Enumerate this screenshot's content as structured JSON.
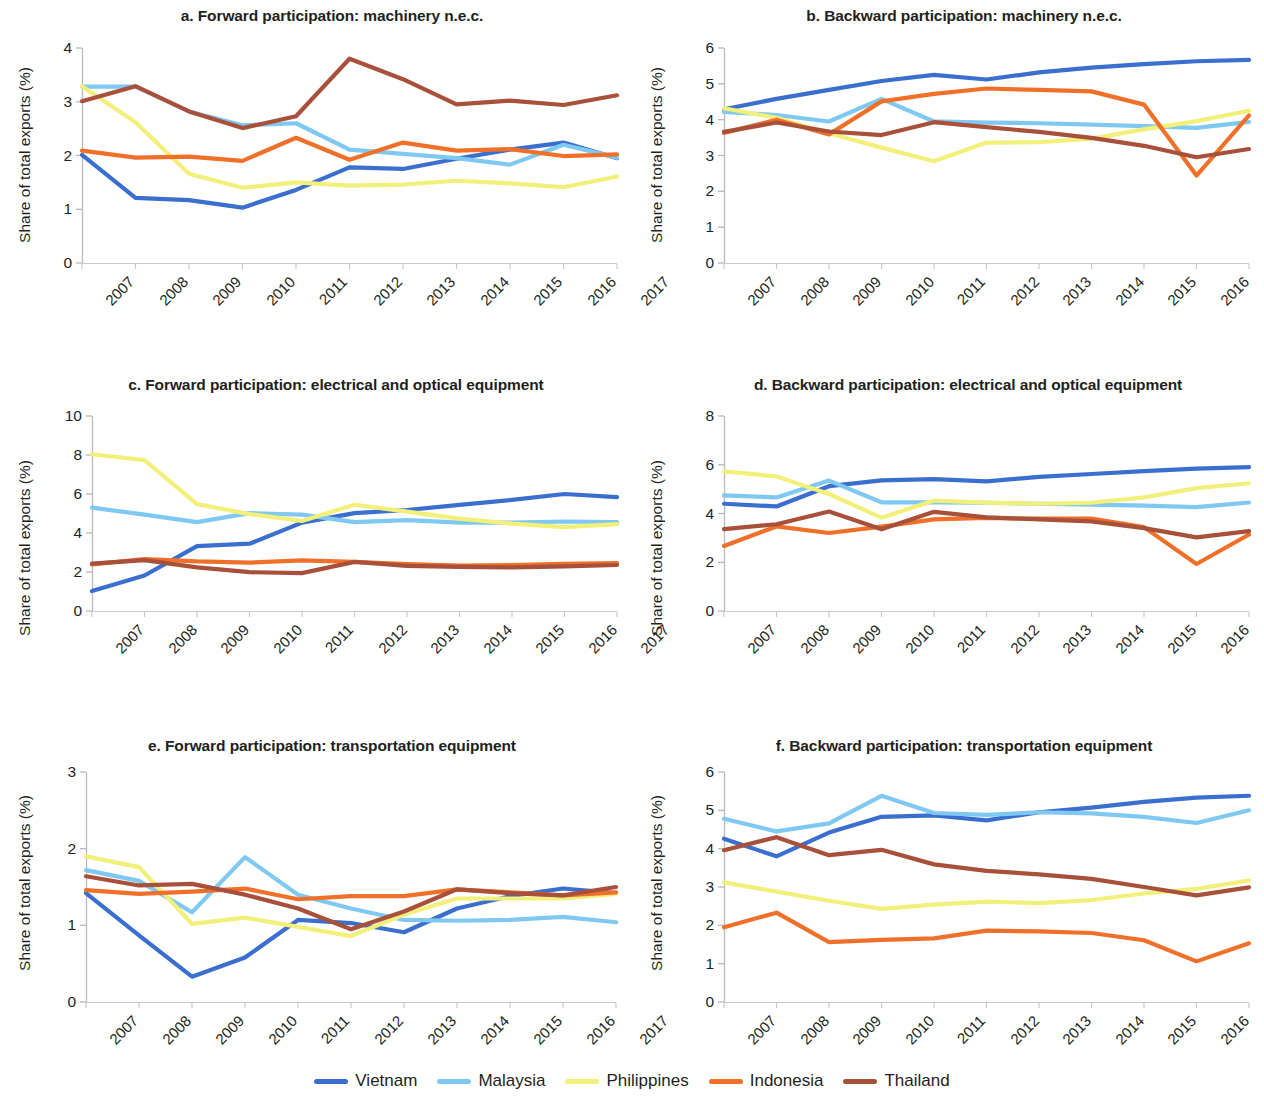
{
  "figure": {
    "ylabel": "Share of total exports (%)",
    "years": [
      "2007",
      "2008",
      "2009",
      "2010",
      "2011",
      "2012",
      "2013",
      "2014",
      "2015",
      "2016",
      "2017"
    ]
  },
  "legend": {
    "items": [
      {
        "name": "Vietnam",
        "color": "#3a6fd0"
      },
      {
        "name": "Malaysia",
        "color": "#7ec8f2"
      },
      {
        "name": "Philippines",
        "color": "#f2f07a"
      },
      {
        "name": "Indonesia",
        "color": "#f0702a"
      },
      {
        "name": "Thailand",
        "color": "#a9503a"
      }
    ]
  },
  "chart_data": [
    {
      "id": "a",
      "type": "line",
      "title": "a. Forward participation: machinery n.e.c.",
      "xlabel": "",
      "ylabel": "Share of total exports (%)",
      "x": [
        "2007",
        "2008",
        "2009",
        "2010",
        "2011",
        "2012",
        "2013",
        "2014",
        "2015",
        "2016",
        "2017"
      ],
      "ylim": [
        0,
        4
      ],
      "yticks": [
        0,
        1,
        2,
        3,
        4
      ],
      "grid": false,
      "legend_position": "below-figure",
      "series": [
        {
          "name": "Vietnam",
          "color": "#3a6fd0",
          "values": [
            2.01,
            1.21,
            1.17,
            1.03,
            1.36,
            1.78,
            1.75,
            1.94,
            2.11,
            2.24,
            1.95
          ]
        },
        {
          "name": "Malaysia",
          "color": "#7ec8f2",
          "values": [
            3.28,
            3.28,
            2.82,
            2.56,
            2.6,
            2.11,
            2.03,
            1.95,
            1.83,
            2.2,
            1.96
          ]
        },
        {
          "name": "Philippines",
          "color": "#f2f07a",
          "values": [
            3.29,
            2.62,
            1.66,
            1.4,
            1.5,
            1.44,
            1.46,
            1.53,
            1.48,
            1.41,
            1.61
          ]
        },
        {
          "name": "Indonesia",
          "color": "#f0702a",
          "values": [
            2.09,
            1.96,
            1.98,
            1.9,
            2.33,
            1.92,
            2.24,
            2.09,
            2.12,
            1.99,
            2.02
          ]
        },
        {
          "name": "Thailand",
          "color": "#a9503a",
          "values": [
            3.01,
            3.29,
            2.82,
            2.51,
            2.73,
            3.8,
            3.42,
            2.95,
            3.02,
            2.94,
            3.12
          ]
        }
      ]
    },
    {
      "id": "b",
      "type": "line",
      "title": "b. Backward participation: machinery n.e.c.",
      "xlabel": "",
      "ylabel": "Share of total exports (%)",
      "x": [
        "2007",
        "2008",
        "2009",
        "2010",
        "2011",
        "2012",
        "2013",
        "2014",
        "2015",
        "2016",
        "2017"
      ],
      "ylim": [
        0,
        6
      ],
      "yticks": [
        0,
        1,
        2,
        3,
        4,
        5,
        6
      ],
      "grid": false,
      "legend_position": "below-figure",
      "series": [
        {
          "name": "Vietnam",
          "color": "#3a6fd0",
          "values": [
            4.29,
            4.58,
            4.83,
            5.08,
            5.25,
            5.12,
            5.32,
            5.45,
            5.55,
            5.63,
            5.67
          ]
        },
        {
          "name": "Malaysia",
          "color": "#7ec8f2",
          "values": [
            4.22,
            4.13,
            3.95,
            4.58,
            3.95,
            3.92,
            3.9,
            3.86,
            3.82,
            3.77,
            3.94
          ]
        },
        {
          "name": "Philippines",
          "color": "#f2f07a",
          "values": [
            4.32,
            4.05,
            3.62,
            3.22,
            2.84,
            3.36,
            3.37,
            3.47,
            3.73,
            3.96,
            4.25
          ]
        },
        {
          "name": "Indonesia",
          "color": "#f0702a",
          "values": [
            3.63,
            4.0,
            3.59,
            4.51,
            4.72,
            4.87,
            4.83,
            4.79,
            4.42,
            2.44,
            4.12
          ]
        },
        {
          "name": "Thailand",
          "color": "#a9503a",
          "values": [
            3.66,
            3.92,
            3.67,
            3.57,
            3.93,
            3.79,
            3.66,
            3.49,
            3.27,
            2.95,
            3.18
          ]
        }
      ]
    },
    {
      "id": "c",
      "type": "line",
      "title": "c. Forward participation: electrical and optical equipment",
      "xlabel": "",
      "ylabel": "Share of total exports (%)",
      "x": [
        "2007",
        "2008",
        "2009",
        "2010",
        "2011",
        "2012",
        "2013",
        "2014",
        "2015",
        "2016",
        "2017"
      ],
      "ylim": [
        0,
        10
      ],
      "yticks": [
        0,
        2,
        4,
        6,
        8,
        10
      ],
      "grid": false,
      "legend_position": "below-figure",
      "series": [
        {
          "name": "Vietnam",
          "color": "#3a6fd0",
          "values": [
            1.02,
            1.82,
            3.33,
            3.45,
            4.53,
            5.02,
            5.18,
            5.44,
            5.7,
            6.0,
            5.84
          ]
        },
        {
          "name": "Malaysia",
          "color": "#7ec8f2",
          "values": [
            5.3,
            4.94,
            4.56,
            5.02,
            4.94,
            4.56,
            4.66,
            4.53,
            4.53,
            4.59,
            4.56
          ]
        },
        {
          "name": "Philippines",
          "color": "#f2f07a",
          "values": [
            8.04,
            7.74,
            5.48,
            4.97,
            4.62,
            5.45,
            5.1,
            4.74,
            4.48,
            4.3,
            4.46
          ]
        },
        {
          "name": "Indonesia",
          "color": "#f0702a",
          "values": [
            2.39,
            2.66,
            2.54,
            2.48,
            2.6,
            2.52,
            2.4,
            2.33,
            2.35,
            2.42,
            2.45
          ]
        },
        {
          "name": "Thailand",
          "color": "#a9503a",
          "values": [
            2.43,
            2.61,
            2.24,
            1.99,
            1.94,
            2.52,
            2.31,
            2.26,
            2.24,
            2.29,
            2.36
          ]
        }
      ]
    },
    {
      "id": "d",
      "type": "line",
      "title": "d. Backward participation: electrical and optical equipment",
      "xlabel": "",
      "ylabel": "Share of total exports (%)",
      "x": [
        "2007",
        "2008",
        "2009",
        "2010",
        "2011",
        "2012",
        "2013",
        "2014",
        "2015",
        "2016",
        "2017"
      ],
      "ylim": [
        0,
        8
      ],
      "yticks": [
        0,
        2,
        4,
        6,
        8
      ],
      "grid": false,
      "legend_position": "below-figure",
      "series": [
        {
          "name": "Vietnam",
          "color": "#3a6fd0",
          "values": [
            4.4,
            4.29,
            5.12,
            5.36,
            5.41,
            5.32,
            5.5,
            5.62,
            5.74,
            5.84,
            5.9
          ]
        },
        {
          "name": "Malaysia",
          "color": "#7ec8f2",
          "values": [
            4.74,
            4.66,
            5.35,
            4.46,
            4.46,
            4.44,
            4.4,
            4.36,
            4.32,
            4.26,
            4.45
          ]
        },
        {
          "name": "Philippines",
          "color": "#f2f07a",
          "values": [
            5.73,
            5.52,
            4.8,
            3.83,
            4.53,
            4.45,
            4.4,
            4.44,
            4.66,
            5.04,
            5.24
          ]
        },
        {
          "name": "Indonesia",
          "color": "#f0702a",
          "values": [
            2.67,
            3.47,
            3.2,
            3.46,
            3.76,
            3.82,
            3.79,
            3.79,
            3.44,
            1.93,
            3.14
          ]
        },
        {
          "name": "Thailand",
          "color": "#a9503a",
          "values": [
            3.36,
            3.56,
            4.08,
            3.35,
            4.07,
            3.84,
            3.76,
            3.68,
            3.4,
            3.02,
            3.28
          ]
        }
      ]
    },
    {
      "id": "e",
      "type": "line",
      "title": "e. Forward participation: transportation equipment",
      "xlabel": "",
      "ylabel": "Share of total exports (%)",
      "x": [
        "2007",
        "2008",
        "2009",
        "2010",
        "2011",
        "2012",
        "2013",
        "2014",
        "2015",
        "2016",
        "2017"
      ],
      "ylim": [
        0,
        3
      ],
      "yticks": [
        0,
        1,
        2,
        3
      ],
      "grid": false,
      "legend_position": "below-figure",
      "series": [
        {
          "name": "Vietnam",
          "color": "#3a6fd0",
          "values": [
            1.42,
            0.87,
            0.33,
            0.58,
            1.07,
            1.03,
            0.91,
            1.22,
            1.38,
            1.48,
            1.42
          ]
        },
        {
          "name": "Malaysia",
          "color": "#7ec8f2",
          "values": [
            1.72,
            1.58,
            1.17,
            1.89,
            1.4,
            1.22,
            1.07,
            1.06,
            1.07,
            1.11,
            1.04
          ]
        },
        {
          "name": "Philippines",
          "color": "#f2f07a",
          "values": [
            1.9,
            1.76,
            1.02,
            1.1,
            0.98,
            0.86,
            1.14,
            1.35,
            1.35,
            1.35,
            1.41
          ]
        },
        {
          "name": "Indonesia",
          "color": "#f0702a",
          "values": [
            1.46,
            1.41,
            1.44,
            1.48,
            1.34,
            1.38,
            1.38,
            1.47,
            1.43,
            1.39,
            1.43
          ]
        },
        {
          "name": "Thailand",
          "color": "#a9503a",
          "values": [
            1.64,
            1.52,
            1.54,
            1.4,
            1.22,
            0.95,
            1.18,
            1.47,
            1.42,
            1.39,
            1.5
          ]
        }
      ]
    },
    {
      "id": "f",
      "type": "line",
      "title": "f. Backward participation: transportation equipment",
      "xlabel": "",
      "ylabel": "Share of total exports (%)",
      "x": [
        "2007",
        "2008",
        "2009",
        "2010",
        "2011",
        "2012",
        "2013",
        "2014",
        "2015",
        "2016",
        "2017"
      ],
      "ylim": [
        0,
        6
      ],
      "yticks": [
        0,
        1,
        2,
        3,
        4,
        5,
        6
      ],
      "grid": false,
      "legend_position": "below-figure",
      "series": [
        {
          "name": "Vietnam",
          "color": "#3a6fd0",
          "values": [
            4.26,
            3.8,
            4.42,
            4.83,
            4.87,
            4.74,
            4.95,
            5.07,
            5.22,
            5.33,
            5.38
          ]
        },
        {
          "name": "Malaysia",
          "color": "#7ec8f2",
          "values": [
            4.78,
            4.45,
            4.66,
            5.38,
            4.93,
            4.88,
            4.95,
            4.92,
            4.83,
            4.67,
            5.0
          ]
        },
        {
          "name": "Philippines",
          "color": "#f2f07a",
          "values": [
            3.12,
            2.88,
            2.64,
            2.43,
            2.54,
            2.62,
            2.58,
            2.66,
            2.83,
            2.95,
            3.17
          ]
        },
        {
          "name": "Indonesia",
          "color": "#f0702a",
          "values": [
            1.95,
            2.33,
            1.56,
            1.62,
            1.66,
            1.86,
            1.84,
            1.8,
            1.61,
            1.06,
            1.53
          ]
        },
        {
          "name": "Thailand",
          "color": "#a9503a",
          "values": [
            3.96,
            4.3,
            3.83,
            3.97,
            3.59,
            3.42,
            3.33,
            3.21,
            3.0,
            2.78,
            2.99
          ]
        }
      ]
    }
  ]
}
